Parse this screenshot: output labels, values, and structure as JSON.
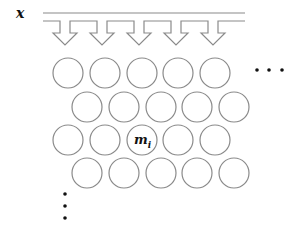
{
  "diagram": {
    "input_label": "x",
    "highlight_label": "m",
    "highlight_subscript": "i",
    "colors": {
      "stroke": "#8a8a8a",
      "text": "#111111",
      "dots": "#111111",
      "background": "#ffffff"
    },
    "arrows": [
      {
        "cx": 65
      },
      {
        "cx": 102
      },
      {
        "cx": 139
      },
      {
        "cx": 176
      },
      {
        "cx": 213
      }
    ],
    "grid": {
      "rows": [
        {
          "y": 73,
          "xs": [
            68,
            105,
            142,
            178,
            215
          ]
        },
        {
          "y": 107,
          "xs": [
            87,
            124,
            161,
            197,
            234
          ]
        },
        {
          "y": 140,
          "xs": [
            68,
            105,
            142,
            178,
            215
          ]
        },
        {
          "y": 173,
          "xs": [
            87,
            124,
            161,
            197,
            234
          ]
        }
      ],
      "radius": 15,
      "highlight": {
        "row": 2,
        "col": 2
      }
    },
    "ellipsis_horizontal": "· · ·",
    "ellipsis_vertical": "⋮"
  }
}
